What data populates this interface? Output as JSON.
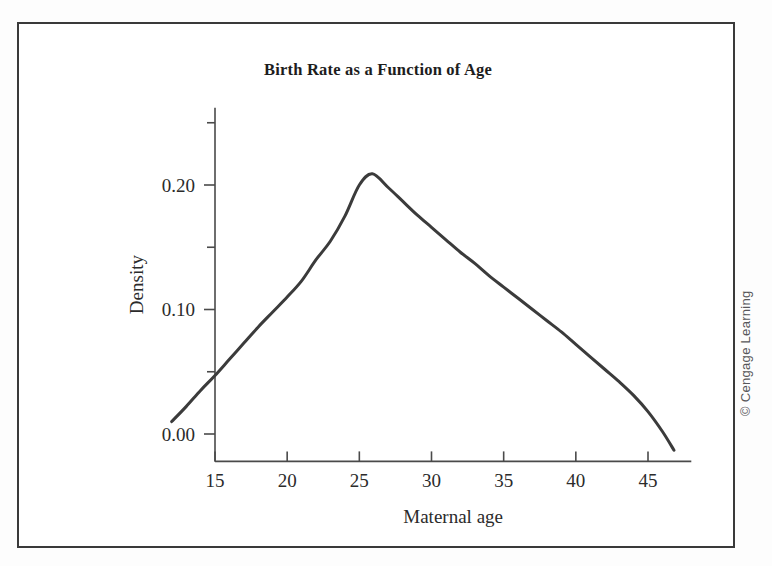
{
  "figure": {
    "title": "Birth Rate as a Function of Age",
    "credit": "© Cengage Learning"
  },
  "chart_data": {
    "type": "line",
    "title": "Birth Rate as a Function of Age",
    "xlabel": "Maternal age",
    "ylabel": "Density",
    "xlim": [
      11.5,
      48.0
    ],
    "ylim": [
      -0.022,
      0.262
    ],
    "grid": false,
    "legend": null,
    "x_ticks": [
      15,
      20,
      25,
      30,
      35,
      40,
      45
    ],
    "x_tick_labels": [
      "15",
      "20",
      "25",
      "30",
      "35",
      "40",
      "45"
    ],
    "y_ticks": [
      0.0,
      0.1,
      0.2
    ],
    "y_tick_labels": [
      "0.00",
      "0.10",
      "0.20"
    ],
    "y_minor_ticks": [
      0.05,
      0.15,
      0.25
    ],
    "series": [
      {
        "name": "Birth rate density",
        "color": "#3b3b3b",
        "line_width": 3,
        "x": [
          12.0,
          13.0,
          14.0,
          15.0,
          16.0,
          17.0,
          18.0,
          19.0,
          20.0,
          21.0,
          22.0,
          23.0,
          24.0,
          25.0,
          25.9,
          27.0,
          28.0,
          29.0,
          30.0,
          31.0,
          32.0,
          33.0,
          34.0,
          35.0,
          36.0,
          37.0,
          38.0,
          39.0,
          40.0,
          41.0,
          42.0,
          43.0,
          44.0,
          45.0,
          46.0,
          46.8
        ],
        "y": [
          0.01,
          0.022,
          0.035,
          0.047,
          0.06,
          0.073,
          0.086,
          0.098,
          0.11,
          0.123,
          0.14,
          0.155,
          0.175,
          0.2,
          0.209,
          0.198,
          0.187,
          0.176,
          0.166,
          0.156,
          0.146,
          0.137,
          0.127,
          0.118,
          0.109,
          0.1,
          0.091,
          0.082,
          0.072,
          0.062,
          0.052,
          0.042,
          0.031,
          0.018,
          0.002,
          -0.013
        ]
      }
    ],
    "peak": {
      "x": 25.9,
      "y": 0.209
    }
  }
}
